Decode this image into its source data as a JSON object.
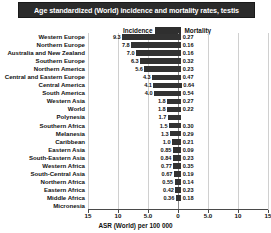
{
  "title": "Age standardized (World) incidence and mortality rates, testis",
  "legend": {
    "incidence_label": "Incidence",
    "mortality_label": "Mortality",
    "swatch_name": "mortality-swatch"
  },
  "axis": {
    "title": "ASR (World) per 100 000",
    "ticks": [
      "15",
      "10",
      "5.0",
      "0",
      "5.0",
      "10",
      "15"
    ],
    "tick_values": [
      -15,
      -10,
      -5,
      0,
      5,
      10,
      15
    ],
    "xmin": -15,
    "xmax": 15
  },
  "colors": {
    "bar": "#323232",
    "title_bg": "#2b2b2b",
    "title_fg": "#ffffff",
    "grid": "#d0d0d0",
    "axis": "#4a4a4a"
  },
  "chart_data": {
    "type": "bar",
    "title": "Age standardized (World) incidence and mortality rates, testis",
    "xlabel": "ASR (World) per 100 000",
    "ylabel": "",
    "xlim": [
      -15,
      15
    ],
    "grid": true,
    "legend_position": "top-center",
    "orientation": "horizontal-diverging",
    "categories": [
      "Western Europe",
      "Northern Europe",
      "Australia and New Zealand",
      "Southern Europe",
      "Northern America",
      "Central and Eastern Europe",
      "Central America",
      "South America",
      "Western Asia",
      "World",
      "Polynesia",
      "Southern Africa",
      "Melanesia",
      "Caribbean",
      "Eastern  Asia",
      "South-Eastern Asia",
      "Western Africa",
      "South-Central Asia",
      "Northern Africa",
      "Eastern Africa",
      "Middle Africa",
      "Micronesia"
    ],
    "series": [
      {
        "name": "Incidence",
        "direction": "left",
        "values": [
          9.3,
          7.8,
          7.0,
          6.3,
          5.6,
          4.3,
          4.1,
          4.0,
          1.8,
          1.8,
          1.7,
          1.5,
          1.3,
          1.0,
          0.85,
          0.84,
          0.77,
          0.67,
          0.55,
          0.42,
          0.36,
          null
        ],
        "labels": [
          "9.3",
          "7.8",
          "7.0",
          "6.3",
          "5.6",
          "4.3",
          "4.1",
          "4.0",
          "1.8",
          "1.8",
          "1.7",
          "1.5",
          "1.3",
          "1.0",
          "0.85",
          "0.84",
          "0.77",
          "0.67",
          "0.55",
          "0.42",
          "0.36",
          ""
        ]
      },
      {
        "name": "Mortality",
        "direction": "right",
        "values": [
          0.27,
          0.16,
          0.16,
          0.32,
          0.23,
          0.47,
          0.64,
          0.54,
          0.27,
          0.22,
          null,
          0.3,
          0.29,
          0.21,
          0.09,
          0.23,
          0.35,
          0.19,
          0.14,
          0.23,
          0.18,
          null
        ],
        "labels": [
          "0.27",
          "0.16",
          "0.16",
          "0.32",
          "0.23",
          "0.47",
          "0.64",
          "0.54",
          "0.27",
          "0.22",
          "",
          "0.30",
          "0.29",
          "0.21",
          "0.09",
          "0.23",
          "0.35",
          "0.19",
          "0.14",
          "0.23",
          "0.18",
          ""
        ]
      }
    ]
  }
}
